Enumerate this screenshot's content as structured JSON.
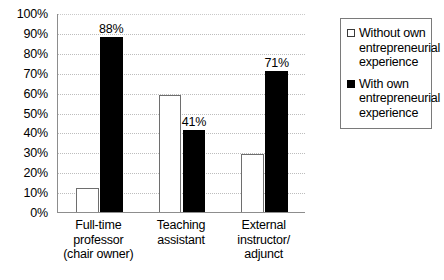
{
  "chart_data": {
    "type": "bar",
    "title": "",
    "xlabel": "",
    "ylabel": "",
    "ylim": [
      0,
      100
    ],
    "y_ticks": [
      "0%",
      "10%",
      "20%",
      "30%",
      "40%",
      "50%",
      "60%",
      "70%",
      "80%",
      "90%",
      "100%"
    ],
    "y_tick_values": [
      0,
      10,
      20,
      30,
      40,
      50,
      60,
      70,
      80,
      90,
      100
    ],
    "grid": true,
    "legend_position": "right",
    "categories": [
      "Full-time\nprofessor\n(chair owner)",
      "Teaching\nassistant",
      "External\ninstructor/\nadjunct"
    ],
    "category_lines": [
      [
        "Full-time",
        "professor",
        "(chair owner)"
      ],
      [
        "Teaching",
        "assistant"
      ],
      [
        "External",
        "instructor/",
        "adjunct"
      ]
    ],
    "series": [
      {
        "name": "Without own entrepreneurial experience",
        "color": "#ffffff",
        "values": [
          12,
          59,
          29
        ],
        "labels": [
          "",
          "",
          ""
        ]
      },
      {
        "name": "With own entrepreneurial experience",
        "color": "#000000",
        "values": [
          88,
          41,
          71
        ],
        "labels": [
          "88%",
          "41%",
          "71%"
        ]
      }
    ]
  },
  "legend": {
    "entries": [
      {
        "swatch": "open-square",
        "label": "Without own entrepreneurial experience"
      },
      {
        "swatch": "filled-square",
        "label": "With own entrepreneurial experience"
      }
    ]
  },
  "colors": {
    "bar_without_fill": "#ffffff",
    "bar_without_border": "#6e6e6e",
    "bar_with_fill": "#000000",
    "axis": "#8d8d8d",
    "gridline": "#bdbdbd",
    "text": "#000000"
  }
}
